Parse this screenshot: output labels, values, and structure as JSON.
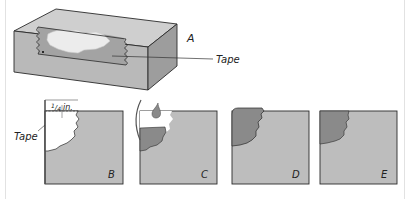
{
  "figure": {
    "box": {
      "label": "A",
      "tape_label": "Tape"
    },
    "panels": [
      {
        "label": "B",
        "callout_tape": "Tape",
        "measure_label": "1/4 in.",
        "measure_num": "1",
        "measure_den": "4",
        "measure_unit": "in."
      },
      {
        "label": "C"
      },
      {
        "label": "D"
      },
      {
        "label": "E"
      }
    ],
    "colors": {
      "wall": "#bdbdbd",
      "wall_dark": "#8f8f8f",
      "wall_side": "#a9a9a9",
      "top_face": "#cfcfcf",
      "patch": "#8a8a8a",
      "damage_light": "#ececec",
      "outline": "#2a2a2a"
    }
  }
}
